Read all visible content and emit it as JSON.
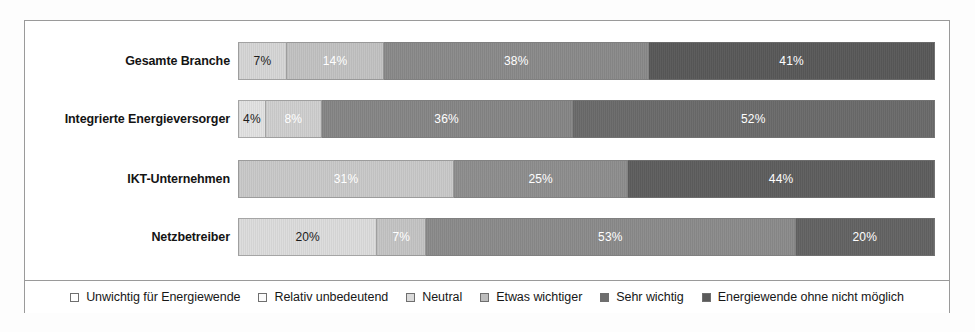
{
  "chart_data": {
    "type": "bar",
    "orientation": "horizontal",
    "stacked": true,
    "normalized": "100%",
    "title": "",
    "subtitle": "",
    "xlabel": "",
    "ylabel": "",
    "xlim": [
      0,
      100
    ],
    "grid": false,
    "legend_position": "bottom",
    "value_suffix": "%",
    "categories": [
      "Gesamte Branche",
      "Integrierte Energieversorger",
      "IKT-Unternehmen",
      "Netzbetreiber"
    ],
    "series": [
      {
        "name": "Unwichtig für Energiewende",
        "color": "#ffffff",
        "values": [
          0,
          0,
          0,
          0
        ]
      },
      {
        "name": "Relativ unbedeutend",
        "color": "#f2f2f2",
        "values": [
          0,
          4,
          0,
          0
        ]
      },
      {
        "name": "Neutral",
        "color": "#d6d6d6",
        "values": [
          7,
          8,
          31,
          20
        ]
      },
      {
        "name": "Etwas wichtiger",
        "color": "#bfbfbf",
        "values": [
          14,
          0,
          0,
          7
        ]
      },
      {
        "name": "Sehr wichtig",
        "color": "#8a8a8a",
        "values": [
          38,
          36,
          25,
          53
        ]
      },
      {
        "name": "Energiewende ohne nicht möglich",
        "color": "#5a5a5a",
        "values": [
          41,
          52,
          44,
          20
        ]
      }
    ],
    "bars": [
      {
        "category": "Gesamte Branche",
        "segments": [
          {
            "series": "Neutral",
            "value": 7,
            "label": "7%",
            "color": "#d6d6d6",
            "text_color": "#1c1c1c"
          },
          {
            "series": "Etwas wichtiger",
            "value": 14,
            "label": "14%",
            "color": "#c2c2c2",
            "text_color": "#ffffff"
          },
          {
            "series": "Sehr wichtig",
            "value": 38,
            "label": "38%",
            "color": "#8a8a8a",
            "text_color": "#ffffff"
          },
          {
            "series": "Energiewende ohne nicht möglich",
            "value": 41,
            "label": "41%",
            "color": "#595959",
            "text_color": "#ffffff"
          }
        ]
      },
      {
        "category": "Integrierte Energieversorger",
        "segments": [
          {
            "series": "Relativ unbedeutend",
            "value": 4,
            "label": "4%",
            "color": "#e2e2e2",
            "text_color": "#1c1c1c"
          },
          {
            "series": "Neutral",
            "value": 8,
            "label": "8%",
            "color": "#cfcfcf",
            "text_color": "#ffffff"
          },
          {
            "series": "Sehr wichtig",
            "value": 36,
            "label": "36%",
            "color": "#868686",
            "text_color": "#ffffff"
          },
          {
            "series": "Energiewende ohne nicht möglich",
            "value": 52,
            "label": "52%",
            "color": "#6b6b6b",
            "text_color": "#ffffff"
          }
        ]
      },
      {
        "category": "IKT-Unternehmen",
        "segments": [
          {
            "series": "Neutral",
            "value": 31,
            "label": "31%",
            "color": "#c9c9c9",
            "text_color": "#ffffff"
          },
          {
            "series": "Sehr wichtig",
            "value": 25,
            "label": "25%",
            "color": "#8e8e8e",
            "text_color": "#ffffff"
          },
          {
            "series": "Energiewende ohne nicht möglich",
            "value": 44,
            "label": "44%",
            "color": "#5e5e5e",
            "text_color": "#ffffff"
          }
        ]
      },
      {
        "category": "Netzbetreiber",
        "segments": [
          {
            "series": "Neutral",
            "value": 20,
            "label": "20%",
            "color": "#dcdcdc",
            "text_color": "#1c1c1c"
          },
          {
            "series": "Etwas wichtiger",
            "value": 7,
            "label": "7%",
            "color": "#c4c4c4",
            "text_color": "#ffffff"
          },
          {
            "series": "Sehr wichtig",
            "value": 53,
            "label": "53%",
            "color": "#8b8b8b",
            "text_color": "#ffffff"
          },
          {
            "series": "Energiewende ohne nicht möglich",
            "value": 20,
            "label": "20%",
            "color": "#636363",
            "text_color": "#ffffff"
          }
        ]
      }
    ]
  },
  "legend": {
    "items": [
      {
        "label": "Unwichtig für Energiewende",
        "color": "#ffffff"
      },
      {
        "label": "Relativ unbedeutend",
        "color": "#fbfbfb"
      },
      {
        "label": "Neutral",
        "color": "#dadada"
      },
      {
        "label": "Etwas wichtiger",
        "color": "#bdbdbd"
      },
      {
        "label": "Sehr wichtig",
        "color": "#6e6e6e"
      },
      {
        "label": "Energiewende ohne nicht möglich",
        "color": "#5a5a5a"
      }
    ]
  },
  "style": {
    "frame_border_color": "#9a9a9a",
    "background": "#ffffff",
    "label_color": "#141414"
  }
}
